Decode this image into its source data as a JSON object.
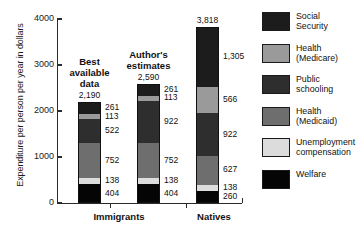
{
  "chart_data": {
    "type": "bar",
    "subtype": "stacked",
    "title": "",
    "xlabel": "",
    "ylabel": "Expenditure per person per year in dollars",
    "ylim": [
      0,
      4000
    ],
    "yticks": [
      0,
      1000,
      2000,
      3000,
      4000
    ],
    "ytick_labels": [
      "0",
      "1000",
      "2000",
      "3000",
      "4000"
    ],
    "grid": false,
    "legend_position": "right",
    "groups": [
      "Immigrants",
      "Natives"
    ],
    "categories": [
      "Best available data",
      "Author's estimates",
      "Natives"
    ],
    "series": [
      {
        "name": "Social Security",
        "color": "#1c1c1c",
        "values": [
          261,
          261,
          1305
        ]
      },
      {
        "name": "Health (Medicare)",
        "color": "#9a9a9a",
        "values": [
          113,
          113,
          566
        ]
      },
      {
        "name": "Public schooling",
        "color": "#2e2e2e",
        "values": [
          522,
          922,
          922
        ]
      },
      {
        "name": "Health (Medicaid)",
        "color": "#6e6e6e",
        "values": [
          752,
          752,
          627
        ]
      },
      {
        "name": "Unemployment compensation",
        "color": "#dcdcdc",
        "values": [
          138,
          138,
          138
        ]
      },
      {
        "name": "Welfare",
        "color": "#050505",
        "values": [
          404,
          404,
          260
        ]
      }
    ],
    "bars": [
      {
        "id": "best-available-data",
        "group": "Immigrants",
        "title_lines": "Best\navailable\ndata",
        "total": 2190,
        "total_label": "2,190",
        "segments": [
          {
            "name": "Social Security",
            "value": 261,
            "label": "261",
            "color": "#1c1c1c"
          },
          {
            "name": "Health (Medicare)",
            "value": 113,
            "label": "113",
            "color": "#9a9a9a"
          },
          {
            "name": "Public schooling",
            "value": 522,
            "label": "522",
            "color": "#2e2e2e"
          },
          {
            "name": "Health (Medicaid)",
            "value": 752,
            "label": "752",
            "color": "#6e6e6e"
          },
          {
            "name": "Unemployment compensation",
            "value": 138,
            "label": "138",
            "color": "#dcdcdc"
          },
          {
            "name": "Welfare",
            "value": 404,
            "label": "404",
            "color": "#050505"
          }
        ]
      },
      {
        "id": "authors-estimates",
        "group": "Immigrants",
        "title_lines": "Author's\nestimates",
        "total": 2590,
        "total_label": "2,590",
        "segments": [
          {
            "name": "Social Security",
            "value": 261,
            "label": "261",
            "color": "#1c1c1c"
          },
          {
            "name": "Health (Medicare)",
            "value": 113,
            "label": "113",
            "color": "#9a9a9a"
          },
          {
            "name": "Public schooling",
            "value": 922,
            "label": "922",
            "color": "#2e2e2e"
          },
          {
            "name": "Health (Medicaid)",
            "value": 752,
            "label": "752",
            "color": "#6e6e6e"
          },
          {
            "name": "Unemployment compensation",
            "value": 138,
            "label": "138",
            "color": "#dcdcdc"
          },
          {
            "name": "Welfare",
            "value": 404,
            "label": "404",
            "color": "#050505"
          }
        ]
      },
      {
        "id": "natives",
        "group": "Natives",
        "title_lines": "",
        "total": 3818,
        "total_label": "3,818",
        "segments": [
          {
            "name": "Social Security",
            "value": 1305,
            "label": "1,305",
            "color": "#1c1c1c"
          },
          {
            "name": "Health (Medicare)",
            "value": 566,
            "label": "566",
            "color": "#9a9a9a"
          },
          {
            "name": "Public schooling",
            "value": 922,
            "label": "922",
            "color": "#2e2e2e"
          },
          {
            "name": "Health (Medicaid)",
            "value": 627,
            "label": "627",
            "color": "#6e6e6e"
          },
          {
            "name": "Unemployment compensation",
            "value": 138,
            "label": "138",
            "color": "#dcdcdc"
          },
          {
            "name": "Welfare",
            "value": 260,
            "label": "260",
            "color": "#050505"
          }
        ]
      }
    ],
    "legend": [
      {
        "label": "Social\nSecurity",
        "color": "#1c1c1c"
      },
      {
        "label": "Health\n(Medicare)",
        "color": "#9a9a9a"
      },
      {
        "label": "Public\nschooling",
        "color": "#2e2e2e"
      },
      {
        "label": "Health\n(Medicaid)",
        "color": "#6e6e6e"
      },
      {
        "label": "Unemployment\ncompensation",
        "color": "#dcdcdc"
      },
      {
        "label": "Welfare",
        "color": "#050505"
      }
    ]
  }
}
